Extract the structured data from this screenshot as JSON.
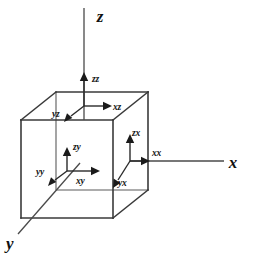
{
  "figure": {
    "background_color": "#ffffff",
    "line_color": "#3a3a3a",
    "label_color": "#111111",
    "width": 256,
    "height": 254
  },
  "axes": [
    {
      "id": "z",
      "label": "z",
      "direction": "up",
      "label_x": 100,
      "label_y": 22
    },
    {
      "id": "x",
      "label": "x",
      "direction": "right",
      "label_x": 233,
      "label_y": 168
    },
    {
      "id": "y",
      "label": "y",
      "direction": "down-left",
      "label_x": 6,
      "label_y": 247
    }
  ],
  "components": [
    {
      "id": "zz",
      "label": "zz",
      "face": "top",
      "direction": "up",
      "label_x": 92,
      "label_y": 82
    },
    {
      "id": "xz",
      "label": "xz",
      "face": "top",
      "direction": "right",
      "label_x": 113,
      "label_y": 110
    },
    {
      "id": "yz",
      "label": "yz",
      "face": "top",
      "direction": "down-left",
      "label_x": 52,
      "label_y": 117
    },
    {
      "id": "zy",
      "label": "zy",
      "face": "front",
      "direction": "up",
      "label_x": 75,
      "label_y": 147
    },
    {
      "id": "xy",
      "label": "xy",
      "face": "front",
      "direction": "right",
      "label_x": 76,
      "label_y": 183
    },
    {
      "id": "yy",
      "label": "yy",
      "face": "front",
      "direction": "down-left",
      "label_x": 38,
      "label_y": 174
    },
    {
      "id": "zx",
      "label": "zx",
      "face": "right",
      "direction": "up",
      "label_x": 132,
      "label_y": 134
    },
    {
      "id": "xx",
      "label": "xx",
      "face": "right",
      "direction": "right",
      "label_x": 152,
      "label_y": 156
    },
    {
      "id": "yx",
      "label": "yx",
      "face": "right",
      "direction": "down-left",
      "label_x": 117,
      "label_y": 186
    }
  ],
  "cube": {
    "front_top_left": [
      21,
      120
    ],
    "front_top_right": [
      113,
      120
    ],
    "front_bottom_right": [
      113,
      218
    ],
    "front_bottom_left": [
      21,
      218
    ],
    "back_top_left": [
      56,
      92
    ],
    "back_top_right": [
      148,
      92
    ],
    "back_bottom_right": [
      148,
      190
    ],
    "back_bottom_left": [
      56,
      190
    ]
  }
}
